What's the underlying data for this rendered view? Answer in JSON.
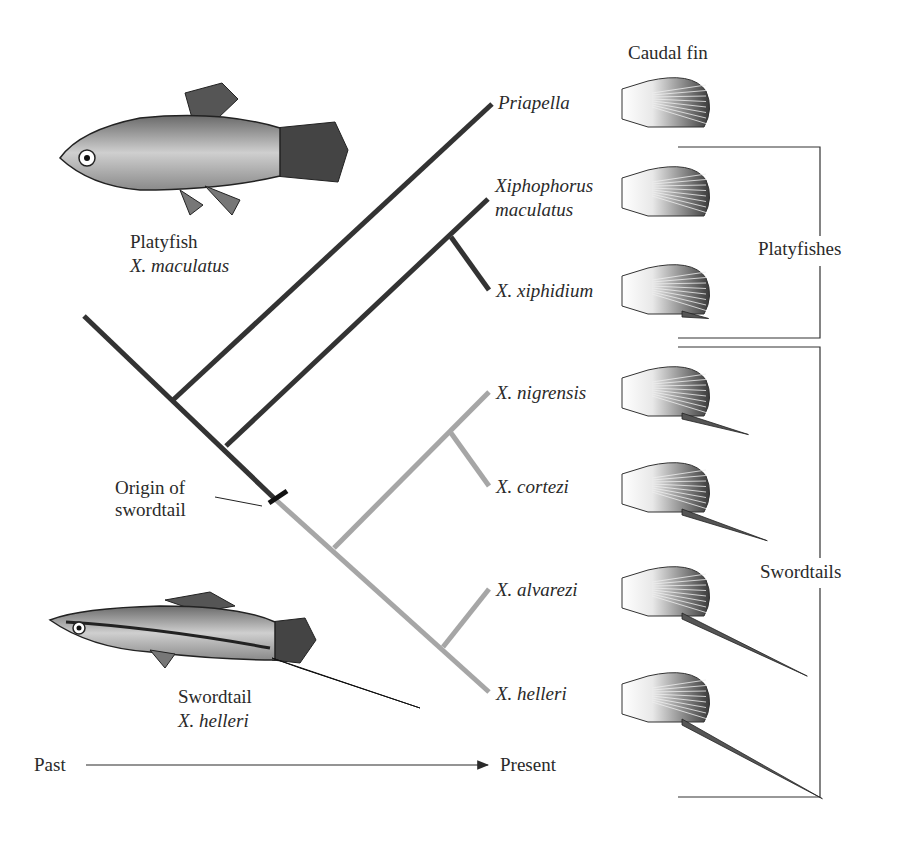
{
  "header": {
    "caudal_fin_label": "Caudal fin"
  },
  "illustrations": {
    "platyfish": {
      "common_name": "Platyfish",
      "species": "X. maculatus"
    },
    "swordtail": {
      "common_name": "Swordtail",
      "species": "X. helleri"
    }
  },
  "tree": {
    "colors": {
      "ancestral": "#333333",
      "swordtail": "#a6a6a6",
      "marker": "#111111"
    },
    "taxa": [
      {
        "id": "priapella",
        "label_lines": [
          "Priapella"
        ],
        "fin": "round",
        "sword": 0
      },
      {
        "id": "xmaculatus",
        "label_lines": [
          "Xiphophorus",
          "maculatus"
        ],
        "fin": "round",
        "sword": 0
      },
      {
        "id": "xxiphidium",
        "label_lines": [
          "X. xiphidium"
        ],
        "fin": "round-point",
        "sword": 0.05
      },
      {
        "id": "xnigrensis",
        "label_lines": [
          "X. nigrensis"
        ],
        "fin": "sword",
        "sword": 0.35
      },
      {
        "id": "xcortezi",
        "label_lines": [
          "X. cortezi"
        ],
        "fin": "sword",
        "sword": 0.5
      },
      {
        "id": "xalvarezi",
        "label_lines": [
          "X. alvarezi"
        ],
        "fin": "sword",
        "sword": 0.85
      },
      {
        "id": "xhelleri",
        "label_lines": [
          "X. helleri"
        ],
        "fin": "sword",
        "sword": 1.0
      }
    ],
    "origin_annotation": [
      "Origin of",
      "swordtail"
    ]
  },
  "groups": [
    {
      "label": "Platyfishes",
      "members": [
        "xmaculatus",
        "xxiphidium"
      ]
    },
    {
      "label": "Swordtails",
      "members": [
        "xnigrensis",
        "xcortezi",
        "xalvarezi",
        "xhelleri"
      ]
    }
  ],
  "time_axis": {
    "start_label": "Past",
    "end_label": "Present"
  }
}
